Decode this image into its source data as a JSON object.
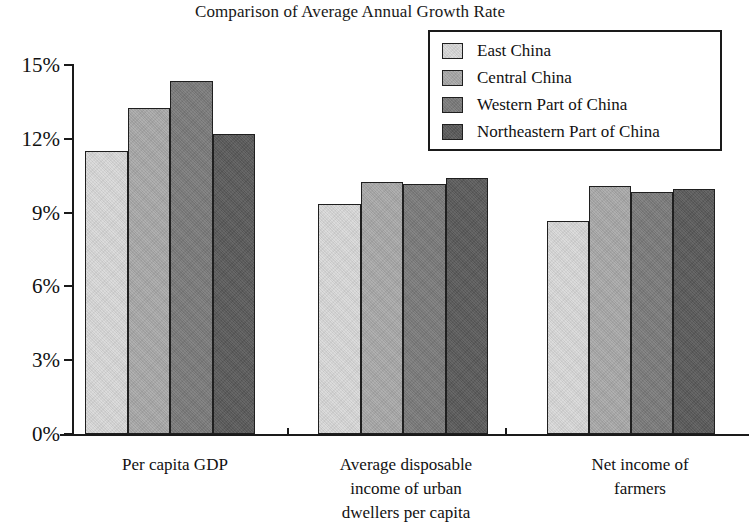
{
  "chart_data": {
    "type": "bar",
    "title": "Comparison of Average Annual Growth Rate",
    "xlabel": "",
    "ylabel": "",
    "categories": [
      "Per capita GDP",
      "Average disposable income of urban dwellers per capita",
      "Net income of farmers"
    ],
    "category_lines": [
      [
        "Per capita GDP"
      ],
      [
        "Average disposable",
        "income of urban",
        "dwellers per capita"
      ],
      [
        "Net income of",
        "farmers"
      ]
    ],
    "series": [
      {
        "name": "East China",
        "color": "#d9d9d9",
        "values": [
          11.5,
          9.35,
          8.65
        ]
      },
      {
        "name": "Central China",
        "color": "#a9a9a9",
        "values": [
          13.25,
          10.25,
          10.1
        ]
      },
      {
        "name": "Western Part of China",
        "color": "#7b7b7b",
        "values": [
          14.35,
          10.15,
          9.85
        ]
      },
      {
        "name": "Northeastern Part of China",
        "color": "#5a5a5a",
        "values": [
          12.2,
          10.4,
          9.95
        ]
      }
    ],
    "ylim": [
      0,
      15
    ],
    "ytick_values": [
      0,
      3,
      6,
      9,
      12,
      15
    ],
    "ytick_labels": [
      "0%",
      "3%",
      "6%",
      "9%",
      "12%",
      "15%"
    ],
    "units": "percent",
    "grid": false,
    "legend_position": "top-right",
    "bar_border_color": "#1f1f1f",
    "axis_color": "#1a1a1a"
  },
  "legend": {
    "items": [
      {
        "label": "East China",
        "color": "#d9d9d9"
      },
      {
        "label": "Central China",
        "color": "#a9a9a9"
      },
      {
        "label": "Western Part of China",
        "color": "#7b7b7b"
      },
      {
        "label": "Northeastern Part of China",
        "color": "#5a5a5a"
      }
    ]
  }
}
